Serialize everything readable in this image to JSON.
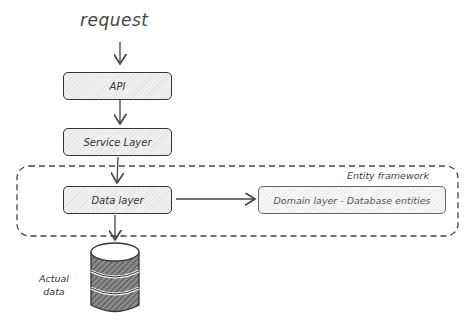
{
  "diagram": {
    "request_label": "request",
    "nodes": {
      "api": "API",
      "service": "Service Layer",
      "data": "Data layer",
      "domain": "Domain layer - Database entities"
    },
    "group_label": "Entity framework",
    "database_label_line1": "Actual",
    "database_label_line2": "data"
  },
  "colors": {
    "stroke": "#333333",
    "fill": "#e8e8e8",
    "background": "#ffffff"
  }
}
